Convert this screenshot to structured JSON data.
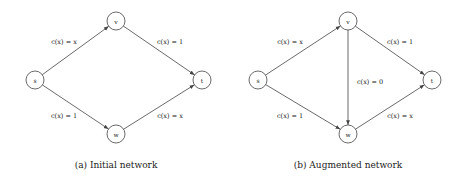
{
  "diagrams": [
    {
      "id": "initial",
      "caption": "(a) Initial network",
      "nodes": [
        {
          "id": "s",
          "label": "s"
        },
        {
          "id": "v",
          "label": "v"
        },
        {
          "id": "w",
          "label": "w"
        },
        {
          "id": "t",
          "label": "t"
        }
      ],
      "edges": [
        {
          "from": "s",
          "to": "v",
          "label": "c(x) = x"
        },
        {
          "from": "v",
          "to": "t",
          "label": "c(x) = 1"
        },
        {
          "from": "s",
          "to": "w",
          "label": "c(x) = 1"
        },
        {
          "from": "w",
          "to": "t",
          "label": "c(x) = x"
        }
      ]
    },
    {
      "id": "augmented",
      "caption": "(b) Augmented network",
      "nodes": [
        {
          "id": "s",
          "label": "s"
        },
        {
          "id": "v",
          "label": "v"
        },
        {
          "id": "w",
          "label": "w"
        },
        {
          "id": "t",
          "label": "t"
        }
      ],
      "edges": [
        {
          "from": "s",
          "to": "v",
          "label": "c(x) = x"
        },
        {
          "from": "v",
          "to": "t",
          "label": "c(x) = 1"
        },
        {
          "from": "v",
          "to": "w",
          "label": "c(x) = 0"
        },
        {
          "from": "s",
          "to": "w",
          "label": "c(x) = 1"
        },
        {
          "from": "w",
          "to": "t",
          "label": "c(x) = x"
        }
      ]
    }
  ]
}
